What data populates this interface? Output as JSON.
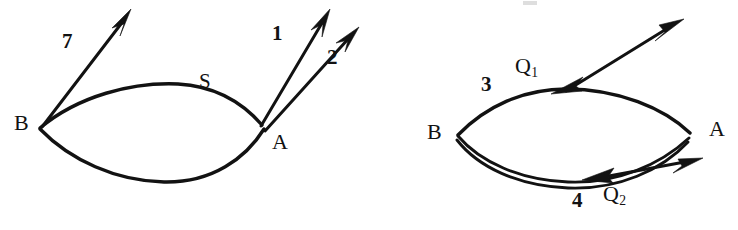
{
  "figure": {
    "caption_present": false,
    "background_color": "#ffffff",
    "ink_color": "#121212",
    "width": 738,
    "height": 230
  },
  "diagram_left": {
    "name": "left-path-diagram",
    "vertices": [
      {
        "id": "B",
        "label": "B",
        "x": 14,
        "y": 112
      },
      {
        "id": "A",
        "label": "A",
        "x": 272,
        "y": 131
      }
    ],
    "path_labels": [
      {
        "id": "S",
        "label": "S",
        "x": 199,
        "y": 71
      }
    ],
    "ray_labels": [
      {
        "id": "ray-7",
        "label": "7",
        "x": 62,
        "y": 31
      },
      {
        "id": "ray-1",
        "label": "1",
        "x": 272,
        "y": 23
      },
      {
        "id": "ray-2",
        "label": "2",
        "x": 327,
        "y": 47
      }
    ]
  },
  "diagram_right": {
    "name": "right-path-diagram",
    "vertices": [
      {
        "id": "B",
        "label": "B",
        "x": 427,
        "y": 121
      },
      {
        "id": "A",
        "label": "A",
        "x": 709,
        "y": 118
      }
    ],
    "path_labels": [
      {
        "id": "Q1",
        "label": "Q",
        "subscript": "1",
        "x": 515,
        "y": 55
      },
      {
        "id": "Q2",
        "label": "Q",
        "subscript": "2",
        "x": 603,
        "y": 183
      }
    ],
    "ray_labels": [
      {
        "id": "ray-3",
        "label": "3",
        "x": 481,
        "y": 74
      },
      {
        "id": "ray-4",
        "label": "4",
        "x": 572,
        "y": 190
      }
    ]
  }
}
